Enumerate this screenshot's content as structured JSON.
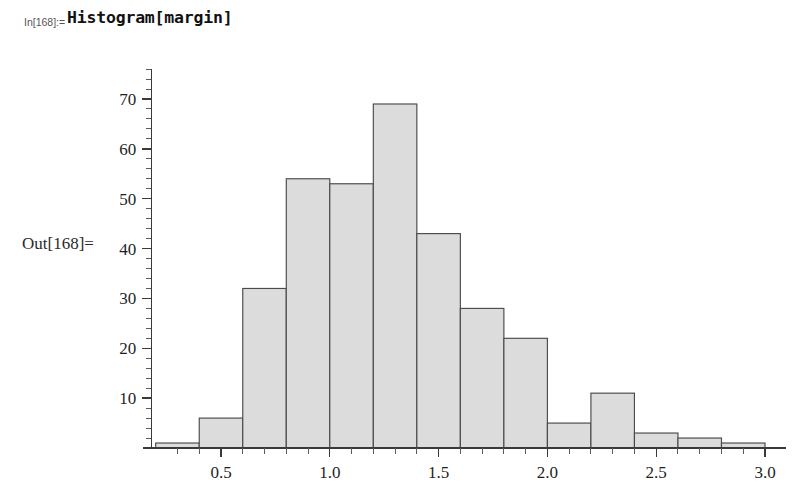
{
  "notebook": {
    "in_label": "In[168]:=",
    "in_expression": "Histogram[margin]",
    "out_label": "Out[168]="
  },
  "colors": {
    "bar_fill": "#dcdcdc",
    "bar_stroke": "#4a4a4a",
    "axis": "#3a3a3a",
    "text": "#1f1f1f",
    "background": "#ffffff",
    "in_label_color": "#555555"
  },
  "chart_data": {
    "type": "bar",
    "title": "",
    "xlabel": "",
    "ylabel": "",
    "bin_width": 0.2,
    "bin_edges": [
      0.2,
      0.4,
      0.6,
      0.8,
      1.0,
      1.2,
      1.4,
      1.6,
      1.8,
      2.0,
      2.2,
      2.4,
      2.6,
      2.8,
      3.0
    ],
    "categories": [
      "0.2-0.4",
      "0.4-0.6",
      "0.6-0.8",
      "0.8-1.0",
      "1.0-1.2",
      "1.2-1.4",
      "1.4-1.6",
      "1.6-1.8",
      "1.8-2.0",
      "2.0-2.2",
      "2.2-2.4",
      "2.4-2.6",
      "2.6-2.8",
      "2.8-3.0"
    ],
    "values": [
      1,
      6,
      32,
      54,
      53,
      69,
      43,
      28,
      22,
      5,
      11,
      3,
      2,
      1
    ],
    "xlim": [
      0.18,
      3.04
    ],
    "ylim": [
      0,
      76
    ],
    "x_major_ticks": [
      0.5,
      1.0,
      1.5,
      2.0,
      2.5,
      3.0
    ],
    "x_major_tick_labels": [
      "0.5",
      "1.0",
      "1.5",
      "2.0",
      "2.5",
      "3.0"
    ],
    "x_minor_tick_step": 0.1,
    "y_major_ticks": [
      10,
      20,
      30,
      40,
      50,
      60,
      70
    ],
    "y_major_tick_labels": [
      "10",
      "20",
      "30",
      "40",
      "50",
      "60",
      "70"
    ],
    "y_minor_tick_step": 2,
    "grid": false,
    "legend": "none"
  }
}
